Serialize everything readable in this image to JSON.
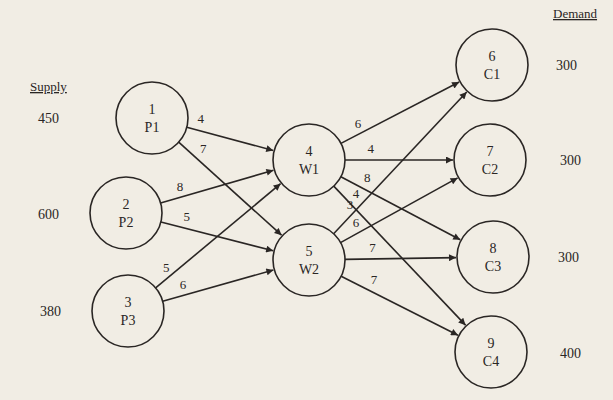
{
  "headers": {
    "supply": "Supply",
    "demand": "Demand"
  },
  "nodes": [
    {
      "id": "1",
      "label": "P1",
      "type": "plant",
      "side_value": "450"
    },
    {
      "id": "2",
      "label": "P2",
      "type": "plant",
      "side_value": "600"
    },
    {
      "id": "3",
      "label": "P3",
      "type": "plant",
      "side_value": "380"
    },
    {
      "id": "4",
      "label": "W1",
      "type": "warehouse",
      "side_value": ""
    },
    {
      "id": "5",
      "label": "W2",
      "type": "warehouse",
      "side_value": ""
    },
    {
      "id": "6",
      "label": "C1",
      "type": "customer",
      "side_value": "300"
    },
    {
      "id": "7",
      "label": "C2",
      "type": "customer",
      "side_value": "300"
    },
    {
      "id": "8",
      "label": "C3",
      "type": "customer",
      "side_value": "300"
    },
    {
      "id": "9",
      "label": "C4",
      "type": "customer",
      "side_value": "400"
    }
  ],
  "edges": [
    {
      "from": "1",
      "to": "4",
      "cost": "4"
    },
    {
      "from": "1",
      "to": "5",
      "cost": "7"
    },
    {
      "from": "2",
      "to": "4",
      "cost": "8"
    },
    {
      "from": "2",
      "to": "5",
      "cost": "5"
    },
    {
      "from": "3",
      "to": "4",
      "cost": "5"
    },
    {
      "from": "3",
      "to": "5",
      "cost": "6"
    },
    {
      "from": "4",
      "to": "6",
      "cost": "6"
    },
    {
      "from": "4",
      "to": "7",
      "cost": "4"
    },
    {
      "from": "4",
      "to": "8",
      "cost": "8"
    },
    {
      "from": "4",
      "to": "9",
      "cost": "4"
    },
    {
      "from": "5",
      "to": "6",
      "cost": "3"
    },
    {
      "from": "5",
      "to": "7",
      "cost": "6"
    },
    {
      "from": "5",
      "to": "8",
      "cost": "7"
    },
    {
      "from": "5",
      "to": "9",
      "cost": "7"
    }
  ]
}
